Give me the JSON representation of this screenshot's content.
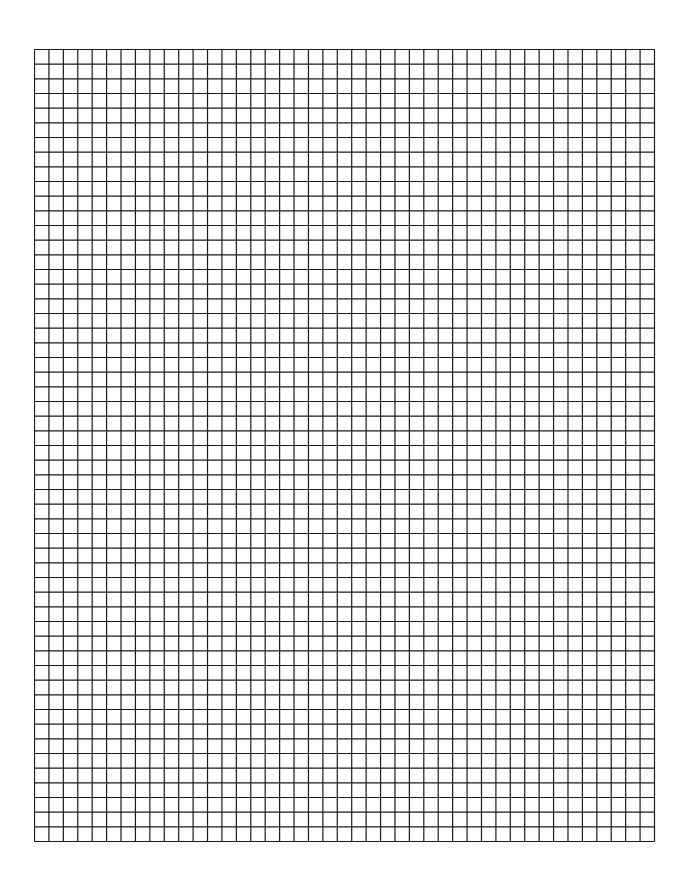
{
  "paper": {
    "background": "#ffffff",
    "line_color": "#1a1a1a",
    "columns": 43,
    "rows": 54,
    "left": 34,
    "top": 49,
    "width": 620,
    "height": 792,
    "line_width": 1.2
  }
}
